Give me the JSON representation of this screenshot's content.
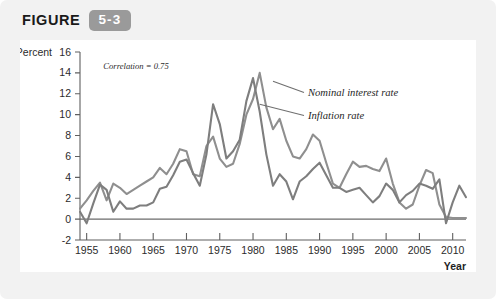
{
  "figure": {
    "label": "FIGURE",
    "number": "5-3"
  },
  "chart_data": {
    "type": "line",
    "title": "",
    "xlabel": "Year",
    "ylabel": "Percent",
    "xlim": [
      1954,
      2012
    ],
    "ylim": [
      -2,
      16
    ],
    "xticks": [
      1955,
      1960,
      1965,
      1970,
      1975,
      1980,
      1985,
      1990,
      1995,
      2000,
      2005,
      2010
    ],
    "yticks": [
      -2,
      0,
      2,
      4,
      6,
      8,
      10,
      12,
      14,
      16
    ],
    "grid": false,
    "legend_position": "inline-right",
    "annotations": [
      {
        "text": "Correlation = 0.75",
        "x": 1957.5,
        "y": 14.4
      }
    ],
    "series": [
      {
        "name": "Nominal interest rate",
        "color": "#8f8f8f",
        "x": [
          1954,
          1955,
          1956,
          1957,
          1958,
          1959,
          1960,
          1961,
          1962,
          1963,
          1964,
          1965,
          1966,
          1967,
          1968,
          1969,
          1970,
          1971,
          1972,
          1973,
          1974,
          1975,
          1976,
          1977,
          1978,
          1979,
          1980,
          1981,
          1982,
          1983,
          1984,
          1985,
          1986,
          1987,
          1988,
          1989,
          1990,
          1991,
          1992,
          1993,
          1994,
          1995,
          1996,
          1997,
          1998,
          1999,
          2000,
          2001,
          2002,
          2003,
          2004,
          2005,
          2006,
          2007,
          2008,
          2009,
          2010,
          2011,
          2012
        ],
        "values": [
          1.0,
          1.8,
          2.7,
          3.5,
          1.8,
          3.4,
          3.0,
          2.4,
          2.8,
          3.2,
          3.6,
          4.0,
          4.9,
          4.3,
          5.3,
          6.7,
          6.5,
          4.3,
          4.1,
          7.0,
          7.9,
          5.8,
          5.0,
          5.3,
          7.2,
          10.0,
          11.5,
          14.0,
          10.7,
          8.6,
          9.6,
          7.5,
          6.0,
          5.8,
          6.7,
          8.1,
          7.5,
          5.4,
          3.4,
          3.0,
          4.3,
          5.5,
          5.0,
          5.1,
          4.8,
          4.6,
          5.8,
          3.4,
          1.6,
          1.0,
          1.4,
          3.2,
          4.7,
          4.4,
          1.4,
          0.2,
          0.1,
          0.1,
          0.1
        ]
      },
      {
        "name": "Inflation rate",
        "color": "#7e7e7e",
        "x": [
          1954,
          1955,
          1956,
          1957,
          1958,
          1959,
          1960,
          1961,
          1962,
          1963,
          1964,
          1965,
          1966,
          1967,
          1968,
          1969,
          1970,
          1971,
          1972,
          1973,
          1974,
          1975,
          1976,
          1977,
          1978,
          1979,
          1980,
          1981,
          1982,
          1983,
          1984,
          1985,
          1986,
          1987,
          1988,
          1989,
          1990,
          1991,
          1992,
          1993,
          1994,
          1995,
          1996,
          1997,
          1998,
          1999,
          2000,
          2001,
          2002,
          2003,
          2004,
          2005,
          2006,
          2007,
          2008,
          2009,
          2010,
          2011,
          2012
        ],
        "values": [
          0.7,
          -0.4,
          1.5,
          3.3,
          2.8,
          0.7,
          1.7,
          1.0,
          1.0,
          1.3,
          1.3,
          1.6,
          2.9,
          3.1,
          4.2,
          5.5,
          5.7,
          4.4,
          3.2,
          6.2,
          11.0,
          9.1,
          5.8,
          6.5,
          7.6,
          11.3,
          13.5,
          10.3,
          6.2,
          3.2,
          4.3,
          3.6,
          1.9,
          3.6,
          4.1,
          4.8,
          5.4,
          4.2,
          3.0,
          3.0,
          2.6,
          2.8,
          3.0,
          2.3,
          1.6,
          2.2,
          3.4,
          2.8,
          1.6,
          2.3,
          2.7,
          3.4,
          3.2,
          2.9,
          3.8,
          -0.4,
          1.6,
          3.2,
          2.1
        ]
      }
    ]
  }
}
